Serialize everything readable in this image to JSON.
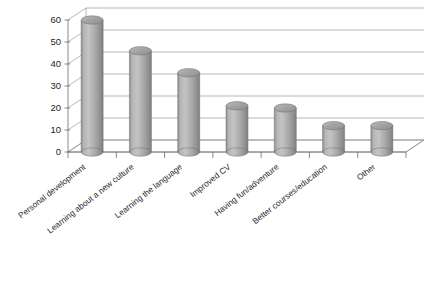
{
  "chart_data": {
    "type": "bar",
    "title": "",
    "subtitle": "",
    "xlabel": "",
    "ylabel": "",
    "categories": [
      "Personal development",
      "Learning about a new culture",
      "Learning the language",
      "Improved CV",
      "Having fun/adventure",
      "Better courses/education",
      "Other"
    ],
    "values": [
      60,
      46,
      36,
      21,
      20,
      12,
      12
    ],
    "ylim": [
      0,
      60
    ],
    "yticks": [
      0,
      10,
      20,
      30,
      40,
      50,
      60
    ],
    "ytick_labels": [
      "0",
      "10",
      "20",
      "30",
      "40",
      "50",
      "60"
    ],
    "grid": true,
    "legend": "none",
    "style": "3d-cylinder",
    "bar_color": "#a0a0a0",
    "bar_edge_color": "#6e6e6e",
    "gridline_color": "#9a9a9a",
    "axis_color": "#6d6d6d",
    "background_color": "#ffffff",
    "label_rotation_degrees": -38
  },
  "axis": {
    "y_tick_labels": [
      "60",
      "50",
      "40",
      "30",
      "20",
      "10",
      "0"
    ],
    "x_tick_count": 8
  },
  "categories": [
    {
      "label": "Personal development",
      "value": 60
    },
    {
      "label": "Learning about a new culture",
      "value": 46
    },
    {
      "label": "Learning the language",
      "value": 36
    },
    {
      "label": "Improved CV",
      "value": 21
    },
    {
      "label": "Having fun/adventure",
      "value": 20
    },
    {
      "label": "Better courses/education",
      "value": 12
    },
    {
      "label": "Other",
      "value": 12
    }
  ]
}
